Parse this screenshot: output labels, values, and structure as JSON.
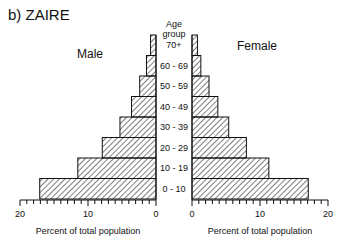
{
  "chart_data": {
    "type": "bar",
    "subtype": "population-pyramid",
    "title": "b) ZAIRE",
    "center_header": [
      "Age",
      "group"
    ],
    "categories": [
      "70+",
      "60 - 69",
      "50 - 59",
      "40 - 49",
      "30 - 39",
      "20 - 29",
      "10 - 19",
      "0 - 10"
    ],
    "series": [
      {
        "name": "Male",
        "side": "left",
        "values": [
          0.8,
          1.4,
          2.4,
          3.6,
          5.3,
          7.9,
          11.5,
          17.1
        ]
      },
      {
        "name": "Female",
        "side": "right",
        "values": [
          0.8,
          1.3,
          2.5,
          3.8,
          5.4,
          8.0,
          11.3,
          17.1
        ]
      }
    ],
    "xlabel": "Percent of total population",
    "xlim": [
      0,
      20
    ],
    "x_ticks": [
      0,
      10,
      20
    ],
    "x_minor_tick_step": 1,
    "fill": "diagonal-hatch",
    "grid": false,
    "legend": "none (side labels Male / Female)"
  },
  "labels": {
    "title": "b) ZAIRE",
    "male": "Male",
    "female": "Female",
    "age_header_1": "Age",
    "age_header_2": "group",
    "xlabel_left": "Percent of total population",
    "xlabel_right": "Percent of total population",
    "tick_left": [
      "20",
      "10",
      "0"
    ],
    "tick_right": [
      "0",
      "10",
      "20"
    ]
  },
  "colors": {
    "ink": "#111111",
    "background": "#ffffff"
  }
}
